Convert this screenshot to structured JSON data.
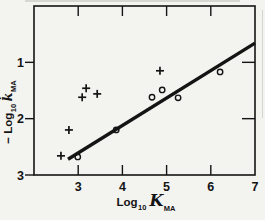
{
  "figure": {
    "bg_color": "#f3f3f0",
    "ink_color": "#141414",
    "artifact_color": "#bfbfba"
  },
  "chart_data": {
    "type": "scatter",
    "title": "",
    "xlabel": "Log10 K MA",
    "ylabel": "-Log10 k MA",
    "xlabel_parts": {
      "log": "Log",
      "sub": "10",
      "sym": "K",
      "symsub": "MA"
    },
    "ylabel_parts": {
      "log": "− Log",
      "sub": "10",
      "sym": "k̇",
      "symsub": "MA"
    },
    "xlim": [
      2,
      7
    ],
    "ylim": [
      0,
      3
    ],
    "y_increases_downward": true,
    "grid": false,
    "legend": "none",
    "x_tick_values": [
      3,
      4,
      5,
      6,
      7
    ],
    "x_tick_labels": [
      "3",
      "4",
      "5",
      "6",
      "7"
    ],
    "x_inner_ticks_top": [
      3,
      4,
      5,
      6
    ],
    "x_inner_ticks_bottom": [
      3,
      4,
      5,
      6
    ],
    "y_tick_values": [
      1,
      2,
      3
    ],
    "y_tick_labels": [
      "1",
      "2",
      "3"
    ],
    "y_outer_ticks_left": [
      1,
      2,
      3
    ],
    "y_inner_ticks_right": [
      1,
      2
    ],
    "series": [
      {
        "name": "plus-markers",
        "marker": "plus",
        "points": [
          [
            2.61,
            2.66
          ],
          [
            2.79,
            2.2
          ],
          [
            3.09,
            1.62
          ],
          [
            3.18,
            1.46
          ],
          [
            3.43,
            1.56
          ],
          [
            4.85,
            1.15
          ]
        ]
      },
      {
        "name": "circle-markers",
        "marker": "circle",
        "points": [
          [
            2.99,
            2.68
          ],
          [
            3.86,
            2.2
          ],
          [
            4.67,
            1.62
          ],
          [
            4.9,
            1.49
          ],
          [
            5.26,
            1.63
          ],
          [
            6.21,
            1.17
          ]
        ]
      }
    ],
    "fit_line": {
      "x1": 2.77,
      "y1": 2.72,
      "x2": 7.0,
      "y2": 0.66
    }
  }
}
